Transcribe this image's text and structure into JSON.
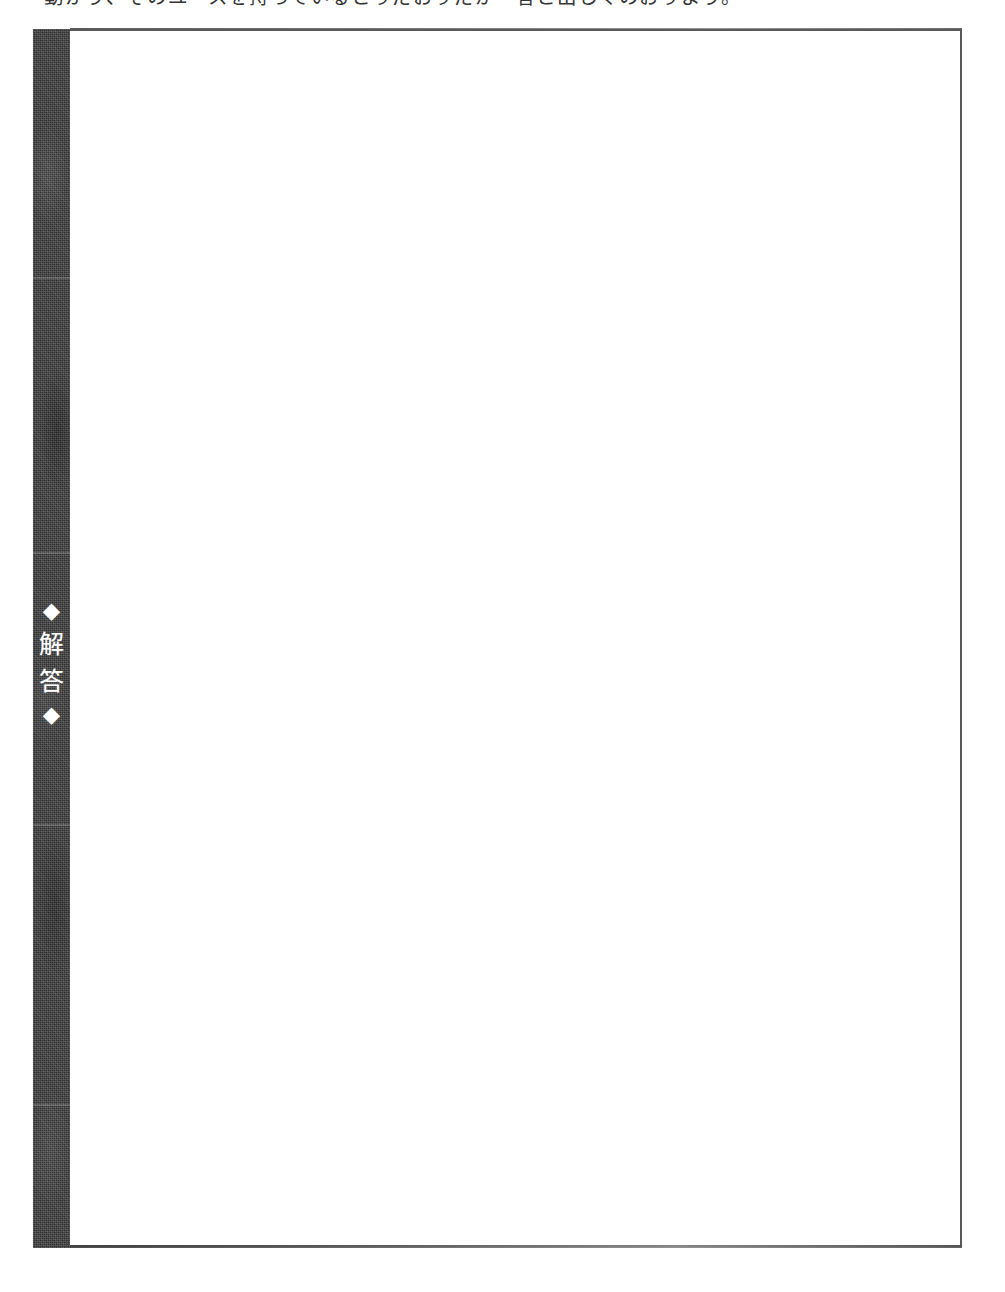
{
  "page": {
    "kind": "scanned-worksheet-page",
    "background_color": "#ffffff",
    "ink_color": "#252525"
  },
  "body_text": {
    "cropped_top_line": "動かう、そのユースを持っているとりだおりだが一答と出しくのおりよう。",
    "note": "partially cropped at top edge of page"
  },
  "answer_section": {
    "tab": {
      "label_open_marker": "◆",
      "label_characters": [
        "解",
        "答"
      ],
      "label_close_marker": "◆",
      "full_label": "◆解答◆",
      "background_color": "#2e2e2e",
      "text_color": "#ffffff"
    },
    "frame": {
      "border_color": "#5a5a5a",
      "fill_color": "#ffffff",
      "content": ""
    }
  }
}
